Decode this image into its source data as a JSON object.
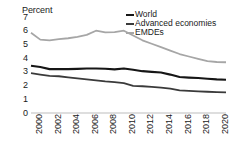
{
  "chart_data": {
    "type": "line",
    "title": "",
    "subtitle": "",
    "xlabel": "",
    "ylabel": "Percent",
    "ylim": [
      0,
      7
    ],
    "xlim": [
      2000,
      2021
    ],
    "yticks": [
      7,
      6,
      5,
      4,
      3,
      2,
      1,
      0
    ],
    "xticks": [
      "2000",
      "2002",
      "2004",
      "2006",
      "2008",
      "2010",
      "2012",
      "2014",
      "2016",
      "2018",
      "2020"
    ],
    "x": [
      2000,
      2001,
      2002,
      2003,
      2004,
      2005,
      2006,
      2007,
      2008,
      2009,
      2010,
      2011,
      2012,
      2013,
      2014,
      2015,
      2016,
      2017,
      2018,
      2019,
      2020,
      2021
    ],
    "grid": false,
    "legend_position": "top-right",
    "series": [
      {
        "name": "World",
        "color": "#161616",
        "width": 2.1,
        "values": [
          3.45,
          3.35,
          3.2,
          3.2,
          3.2,
          3.22,
          3.25,
          3.25,
          3.23,
          3.18,
          3.25,
          3.15,
          3.05,
          3.0,
          2.95,
          2.8,
          2.62,
          2.58,
          2.55,
          2.5,
          2.45,
          2.42
        ]
      },
      {
        "name": "Advanced economies",
        "color": "#3a3a3a",
        "width": 1.8,
        "values": [
          2.9,
          2.8,
          2.7,
          2.68,
          2.6,
          2.52,
          2.45,
          2.38,
          2.3,
          2.25,
          2.18,
          1.98,
          1.95,
          1.9,
          1.85,
          1.78,
          1.65,
          1.62,
          1.58,
          1.55,
          1.52,
          1.5
        ]
      },
      {
        "name": "EMDEs",
        "color": "#a6a6a6",
        "width": 1.8,
        "values": [
          5.85,
          5.35,
          5.3,
          5.38,
          5.45,
          5.55,
          5.7,
          6.0,
          5.88,
          5.9,
          6.0,
          5.65,
          5.3,
          5.05,
          4.8,
          4.55,
          4.3,
          4.12,
          3.95,
          3.78,
          3.72,
          3.7
        ]
      }
    ]
  },
  "legend": {
    "items": [
      {
        "label": "World",
        "color": "#161616"
      },
      {
        "label": "Advanced economies",
        "color": "#3a3a3a"
      },
      {
        "label": "EMDEs",
        "color": "#a6a6a6"
      }
    ]
  },
  "axis": {
    "y_title": "Percent",
    "baseline_color": "#bdbdbd"
  }
}
